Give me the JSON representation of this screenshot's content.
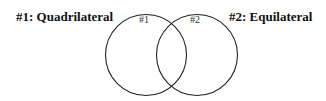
{
  "diagram": {
    "type": "venn",
    "sets": [
      {
        "id": "1",
        "title": "#1: Quadrilateral",
        "circle_label": "#1",
        "center": [
          146,
          55
        ],
        "radius": 40
      },
      {
        "id": "2",
        "title": "#2: Equilateral",
        "circle_label": "#2",
        "center": [
          197,
          55
        ],
        "radius": 40
      }
    ],
    "stroke_color": "#222222",
    "background": "#ffffff"
  }
}
